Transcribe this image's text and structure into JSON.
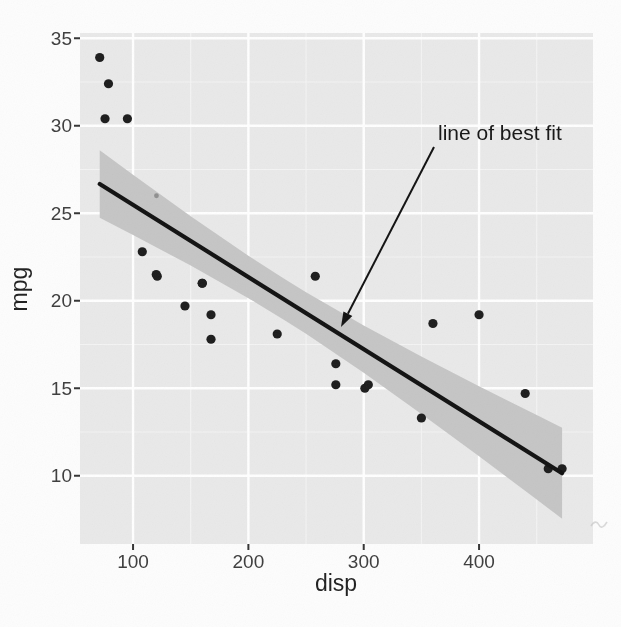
{
  "figure": {
    "background": "#fdfdfd",
    "panel_background": "#e9e9e9",
    "major_grid_color": "#ffffff",
    "minor_grid_color": "#f4f4f4",
    "point_color": "#1b1b1b",
    "faint_point_color": "#8f8f8f",
    "line_color": "#101010",
    "band_color": "#c5c5c5",
    "tick_mark_color": "#333333",
    "artifact_color": "#c2c2c2"
  },
  "chart_data": {
    "type": "scatter",
    "title": "",
    "xlabel": "disp",
    "ylabel": "mpg",
    "xlim": [
      54,
      498.8
    ],
    "ylim": [
      6.1,
      35.3
    ],
    "x_major_ticks": [
      100,
      200,
      300,
      400
    ],
    "x_minor_ticks": [
      150,
      250,
      350,
      450
    ],
    "y_major_ticks": [
      10,
      15,
      20,
      25,
      30,
      35
    ],
    "y_minor_ticks": [
      12.5,
      17.5,
      22.5,
      27.5,
      32.5
    ],
    "grid": "major+minor",
    "legend": "none",
    "points": [
      [
        71.1,
        33.9
      ],
      [
        78.7,
        32.4
      ],
      [
        75.7,
        30.4
      ],
      [
        95.1,
        30.4
      ],
      [
        108,
        22.8
      ],
      [
        120.1,
        21.5
      ],
      [
        121,
        21.4
      ],
      [
        160,
        21
      ],
      [
        160,
        21
      ],
      [
        145,
        19.7
      ],
      [
        167.6,
        19.2
      ],
      [
        167.6,
        17.8
      ],
      [
        225,
        18.1
      ],
      [
        258,
        21.4
      ],
      [
        275.8,
        16.4
      ],
      [
        275.8,
        15.2
      ],
      [
        301,
        15
      ],
      [
        304,
        15.2
      ],
      [
        350,
        13.3
      ],
      [
        360,
        18.7
      ],
      [
        400,
        19.2
      ],
      [
        440,
        14.7
      ],
      [
        460,
        10.4
      ],
      [
        472,
        10.4
      ]
    ],
    "faint_point": [
      120.3,
      26
    ],
    "regression_line": {
      "type": "linear",
      "intercept": 29.6,
      "slope": -0.04122,
      "x_start": 71.1,
      "x_end": 472
    },
    "confidence_band": {
      "level": 0.95,
      "points": [
        {
          "x": 71.1,
          "lower": 24.74,
          "upper": 28.6
        },
        {
          "x": 100,
          "lower": 23.76,
          "upper": 27.2
        },
        {
          "x": 150,
          "lower": 22.01,
          "upper": 24.83
        },
        {
          "x": 200,
          "lower": 20.15,
          "upper": 22.57
        },
        {
          "x": 230.7,
          "lower": 18.92,
          "upper": 21.27
        },
        {
          "x": 250,
          "lower": 18.11,
          "upper": 20.48
        },
        {
          "x": 300,
          "lower": 15.89,
          "upper": 18.59
        },
        {
          "x": 350,
          "lower": 13.53,
          "upper": 16.82
        },
        {
          "x": 400,
          "lower": 11.11,
          "upper": 15.12
        },
        {
          "x": 450,
          "lower": 8.64,
          "upper": 13.47
        },
        {
          "x": 472,
          "lower": 7.54,
          "upper": 12.75
        }
      ]
    },
    "annotation": {
      "text": "line of best fit",
      "text_px": [
        438,
        140
      ],
      "arrow_from_px": [
        434,
        147
      ],
      "arrow_to_px": [
        341,
        327
      ]
    }
  }
}
